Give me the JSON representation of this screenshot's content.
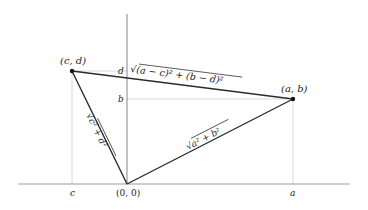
{
  "diagram": {
    "type": "coordinate-geometry-distance",
    "colors": {
      "axis": "#9a9a9a",
      "guide": "#d8d8d8",
      "segment": "#2b2b2b",
      "point": "#111111",
      "text": "#222222"
    },
    "points": [
      {
        "id": "origin",
        "label": "(0, 0)",
        "x": 127,
        "y": 184
      },
      {
        "id": "cd",
        "label": "(c, d)",
        "x": 72,
        "y": 71
      },
      {
        "id": "ab",
        "label": "(a, b)",
        "x": 293,
        "y": 99
      }
    ],
    "axis_labels": {
      "x_c": "c",
      "x_a": "a",
      "y_d": "d",
      "y_b": "b"
    },
    "segments": [
      {
        "id": "cd-ab",
        "label": "√(a − c)² + (b − d)²"
      },
      {
        "id": "origin-ab",
        "label": "√a² + b²"
      },
      {
        "id": "origin-cd",
        "label": "√c² + d²"
      }
    ]
  }
}
